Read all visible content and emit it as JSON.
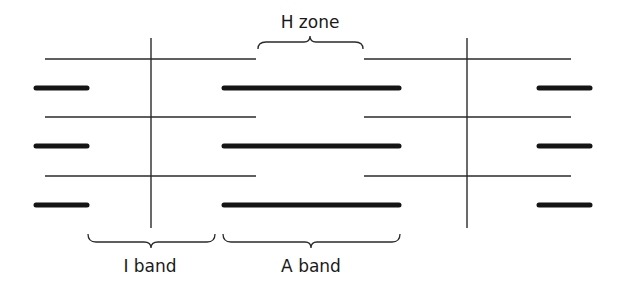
{
  "diagram": {
    "labels": {
      "h_zone": "H zone",
      "i_band": "I band",
      "a_band": "A band"
    },
    "structure": {
      "filament_rows": 3,
      "thin_filament": "actin (thin lines anchored at Z-lines)",
      "thick_filament": "myosin (thick bars, centered)",
      "z_lines": 2
    },
    "colors": {
      "background": "#ffffff",
      "line": "#2a2a2a",
      "thick": "#151515"
    }
  }
}
